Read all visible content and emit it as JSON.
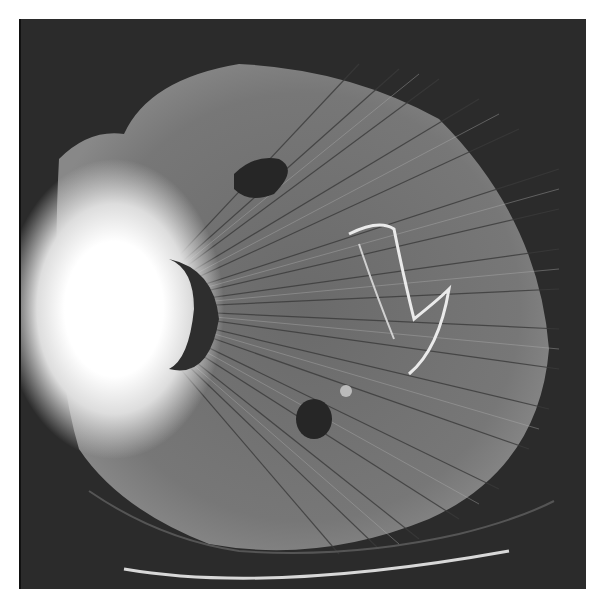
{
  "image": {
    "description": "Axial CT slice of pelvis/hip with severe metal streak artifact from a prosthesis",
    "background_color": "#2b2b2b",
    "frame_color": "#ffffff"
  }
}
